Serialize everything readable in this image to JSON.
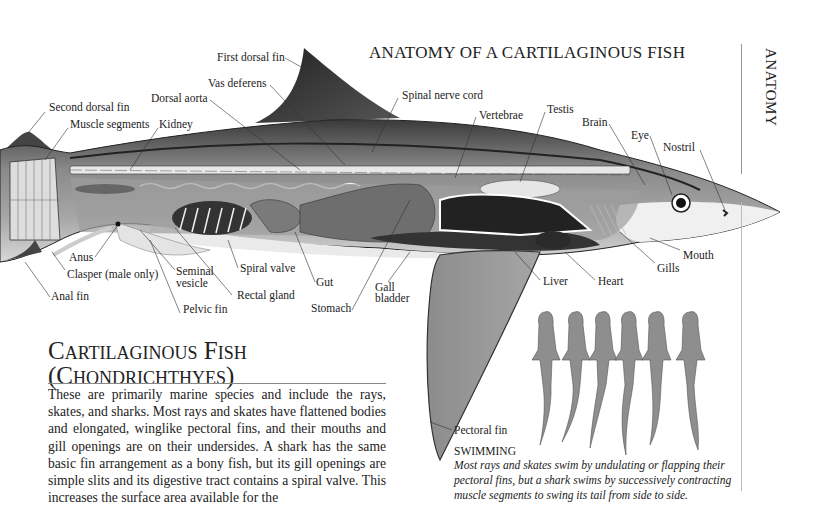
{
  "page": {
    "title": "ANATOMY OF A CARTILAGINOUS FISH",
    "side_tab": "ANATOMY"
  },
  "diagram": {
    "labels": {
      "first_dorsal_fin": "First dorsal fin",
      "vas_deferens": "Vas deferens",
      "dorsal_aorta": "Dorsal aorta",
      "second_dorsal_fin": "Second dorsal fin",
      "muscle_segments": "Muscle segments",
      "kidney": "Kidney",
      "spinal_nerve_cord": "Spinal nerve cord",
      "vertebrae": "Vertebrae",
      "testis": "Testis",
      "brain": "Brain",
      "eye": "Eye",
      "nostril": "Nostril",
      "mouth": "Mouth",
      "gills": "Gills",
      "heart": "Heart",
      "liver": "Liver",
      "gall_bladder": "Gall\nbladder",
      "stomach": "Stomach",
      "gut": "Gut",
      "spiral_valve": "Spiral valve",
      "rectal_gland": "Rectal gland",
      "seminal_vesicle": "Seminal\nvesicle",
      "pelvic_fin": "Pelvic fin",
      "anus": "Anus",
      "clasper": "Clasper (male only)",
      "anal_fin": "Anal fin",
      "pectoral_fin": "Pectoral fin"
    }
  },
  "section": {
    "title_line1": "Cartilaginous Fish",
    "title_line2": "(Chondrichthyes)",
    "body": "These are primarily marine species and include the rays, skates, and sharks. Most rays and skates have flattened bodies and elongated, winglike pectoral fins, and their mouths and gill openings are on their undersides. A shark has the same basic fin arrangement as a bony fish, but its gill openings are simple slits and its digestive tract contains a spiral valve. This increases the surface area available for the"
  },
  "swimming": {
    "heading": "SWIMMING",
    "text": "Most rays and skates swim by undulating or flapping their pectoral fins, but a shark swims by successively contracting muscle segments to swing its tail from side to side.",
    "shark_count": 6
  }
}
